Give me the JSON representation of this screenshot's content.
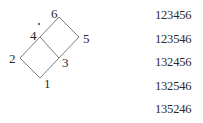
{
  "diagram": {
    "vertices": [
      {
        "id": "1",
        "label": "1",
        "x": 40,
        "y": 78,
        "lx": 44,
        "ly": 88
      },
      {
        "id": "2",
        "label": "2",
        "x": 20,
        "y": 58,
        "lx": 9,
        "ly": 63
      },
      {
        "id": "3",
        "label": "3",
        "x": 59,
        "y": 58,
        "lx": 62,
        "ly": 67
      },
      {
        "id": "4",
        "label": "4",
        "x": 40,
        "y": 37,
        "lx": 30,
        "ly": 40
      },
      {
        "id": "5",
        "label": "5",
        "x": 79,
        "y": 37,
        "lx": 83,
        "ly": 43
      },
      {
        "id": "6",
        "label": "6",
        "x": 59,
        "y": 17,
        "lx": 51,
        "ly": 18
      }
    ],
    "edges": [
      [
        "1",
        "2"
      ],
      [
        "1",
        "3"
      ],
      [
        "2",
        "4"
      ],
      [
        "3",
        "4"
      ],
      [
        "3",
        "5"
      ],
      [
        "4",
        "6"
      ],
      [
        "5",
        "6"
      ]
    ],
    "dot": {
      "x": 39,
      "y": 24
    },
    "line_color": "#7a7a7a"
  },
  "sequences": [
    "123456",
    "123546",
    "132456",
    "132546",
    "135246"
  ]
}
